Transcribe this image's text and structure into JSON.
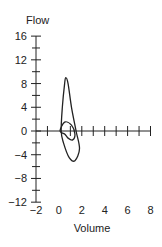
{
  "chart_data": {
    "type": "line",
    "title": "",
    "xlabel": "Volume",
    "ylabel": "Flow",
    "xlim": [
      -2,
      8
    ],
    "ylim": [
      -12,
      16
    ],
    "x_ticks": [
      -2,
      0,
      2,
      4,
      6,
      8
    ],
    "y_ticks": [
      16,
      12,
      8,
      4,
      0,
      -4,
      -8,
      -12
    ],
    "grid": false,
    "legend": null,
    "series": [
      {
        "name": "outer contour",
        "closed": true,
        "points": [
          [
            0.2,
            0
          ],
          [
            0.3,
            4
          ],
          [
            0.5,
            8
          ],
          [
            0.6,
            9
          ],
          [
            0.8,
            8
          ],
          [
            1.1,
            4
          ],
          [
            1.5,
            0
          ],
          [
            1.8,
            -3
          ],
          [
            1.4,
            -5
          ],
          [
            0.9,
            -4.5
          ],
          [
            0.4,
            -2
          ],
          [
            0.2,
            0
          ]
        ]
      },
      {
        "name": "inner contour",
        "closed": true,
        "points": [
          [
            0.1,
            0
          ],
          [
            0.5,
            1.5
          ],
          [
            1.1,
            1
          ],
          [
            1.4,
            -0.5
          ],
          [
            1.2,
            -1.5
          ],
          [
            0.8,
            -1.2
          ],
          [
            0.5,
            -0.5
          ],
          [
            0.1,
            0
          ]
        ]
      }
    ]
  }
}
